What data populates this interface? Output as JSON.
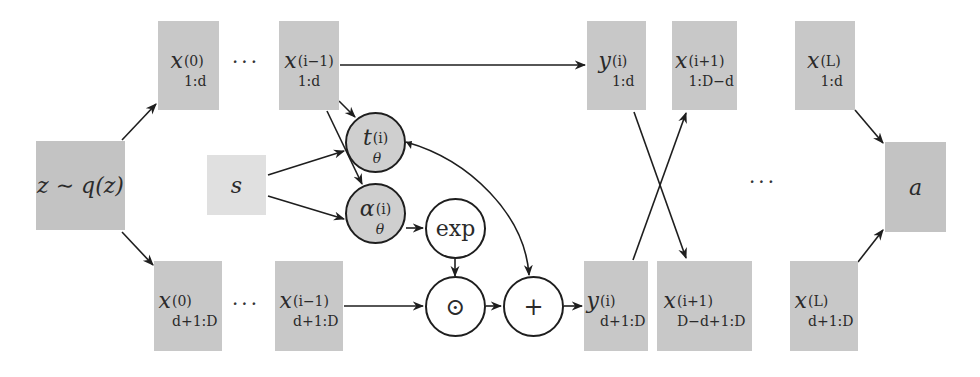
{
  "diagram": {
    "type": "flow-architecture",
    "colors": {
      "box_fill": "#c8c8c8",
      "state_box_fill": "#e0e0e0",
      "network_node_fill": "#cfcfcf",
      "op_node_fill": "#ffffff",
      "stroke": "#1e1e1e"
    },
    "nodes": {
      "latent": {
        "label": "z ∼ q(z)"
      },
      "state": {
        "label": "s"
      },
      "x0_top": {
        "base": "x",
        "sup": "(0)",
        "sub": "1:d"
      },
      "xim1_top": {
        "base": "x",
        "sup": "(i−1)",
        "sub": "1:d"
      },
      "x0_bottom": {
        "base": "x",
        "sup": "(0)",
        "sub": "d+1:D"
      },
      "xim1_bottom": {
        "base": "x",
        "sup": "(i−1)",
        "sub": "d+1:D"
      },
      "t_net": {
        "base": "t",
        "sup": "(i)",
        "sub": "θ"
      },
      "alpha_net": {
        "base": "α",
        "sup": "(i)",
        "sub": "θ"
      },
      "exp_op": {
        "label": "exp"
      },
      "hadamard_op": {
        "label": "⊙"
      },
      "plus_op": {
        "label": "+"
      },
      "yi_top": {
        "base": "y",
        "sup": "(i)",
        "sub": "1:d"
      },
      "yi_bottom": {
        "base": "y",
        "sup": "(i)",
        "sub": "d+1:D"
      },
      "xip1_top": {
        "base": "x",
        "sup": "(i+1)",
        "sub": "1:D−d"
      },
      "xip1_bottom": {
        "base": "x",
        "sup": "(i+1)",
        "sub": "D−d+1:D"
      },
      "xL_top": {
        "base": "x",
        "sup": "(L)",
        "sub": "1:d"
      },
      "xL_bottom": {
        "base": "x",
        "sup": "(L)",
        "sub": "d+1:D"
      },
      "action": {
        "label": "a"
      }
    },
    "ellipses": {
      "top_left": "···",
      "bottom_left": "···",
      "right_middle": "···"
    },
    "edges": [
      {
        "from": "latent",
        "to": "x0_top"
      },
      {
        "from": "latent",
        "to": "x0_bottom"
      },
      {
        "from": "xim1_top",
        "to": "yi_top"
      },
      {
        "from": "xim1_top",
        "to": "t_net"
      },
      {
        "from": "xim1_top",
        "to": "alpha_net"
      },
      {
        "from": "state",
        "to": "t_net"
      },
      {
        "from": "state",
        "to": "alpha_net"
      },
      {
        "from": "alpha_net",
        "to": "exp_op"
      },
      {
        "from": "exp_op",
        "to": "hadamard_op"
      },
      {
        "from": "xim1_bottom",
        "to": "hadamard_op"
      },
      {
        "from": "hadamard_op",
        "to": "plus_op"
      },
      {
        "from": "t_net",
        "to": "plus_op"
      },
      {
        "from": "plus_op",
        "to": "yi_bottom"
      },
      {
        "from": "yi_top",
        "to": "xip1_bottom"
      },
      {
        "from": "yi_bottom",
        "to": "xip1_top"
      },
      {
        "from": "xL_top",
        "to": "action"
      },
      {
        "from": "xL_bottom",
        "to": "action"
      }
    ]
  }
}
